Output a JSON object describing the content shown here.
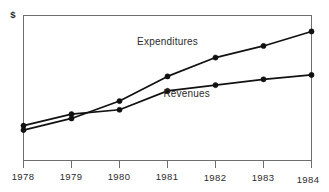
{
  "chart_data": {
    "type": "line",
    "title": "",
    "xlabel": "",
    "ylabel": "$",
    "categories": [
      "1978",
      "1979",
      "1980",
      "1981",
      "1982",
      "1983",
      "1984"
    ],
    "x": [
      1978,
      1979,
      1980,
      1981,
      1982,
      1983,
      1984
    ],
    "xlim": [
      1978,
      1984
    ],
    "ylim": [
      0,
      100
    ],
    "grid": false,
    "legend_position": "inline-annotation",
    "series": [
      {
        "name": "Expenditures",
        "values": [
          21,
          29,
          41,
          58,
          71,
          79,
          89
        ],
        "label_x": 1981.0,
        "label_y": 80
      },
      {
        "name": "Revenues",
        "values": [
          24,
          32,
          35,
          48,
          52,
          56,
          59
        ],
        "label_x": 1981.4,
        "label_y": 44
      }
    ],
    "annotations": [
      {
        "text": "Expenditures",
        "series": "Expenditures"
      },
      {
        "text": "Revenues",
        "series": "Revenues"
      }
    ]
  },
  "axes": {
    "y_axis_title": "$",
    "x_tick_labels": [
      "1978",
      "1979",
      "1980",
      "1981",
      "1982",
      "1983",
      "1984"
    ]
  }
}
